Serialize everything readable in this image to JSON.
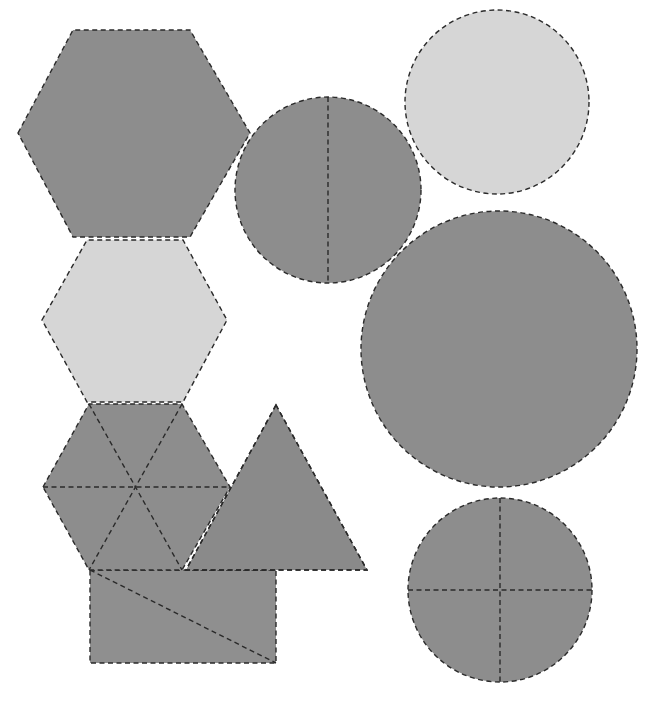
{
  "diagram": {
    "colors": {
      "dark_fill": "#8d8d8d",
      "light_fill": "#d6d6d6",
      "outline": "#2a2a2a",
      "background": "#ffffff"
    },
    "shapes": [
      {
        "id": "hexagon-top",
        "type": "hexagon",
        "fill": "dark",
        "partitions": 0,
        "points": [
          [
            18,
            133
          ],
          [
            73,
            30
          ],
          [
            190,
            30
          ],
          [
            250,
            133
          ],
          [
            190,
            237
          ],
          [
            73,
            237
          ]
        ]
      },
      {
        "id": "hexagon-middle",
        "type": "hexagon",
        "fill": "light",
        "partitions": 0,
        "points": [
          [
            42,
            320
          ],
          [
            87,
            240
          ],
          [
            183,
            240
          ],
          [
            227,
            320
          ],
          [
            183,
            402
          ],
          [
            87,
            402
          ]
        ]
      },
      {
        "id": "hexagon-bottom",
        "type": "hexagon",
        "fill": "dark",
        "partitions": 6,
        "points": [
          [
            43,
            487
          ],
          [
            89,
            404
          ],
          [
            182,
            404
          ],
          [
            230,
            487
          ],
          [
            182,
            570
          ],
          [
            89,
            570
          ]
        ],
        "center": [
          136,
          487
        ]
      },
      {
        "id": "triangle",
        "type": "triangle",
        "fill": "dark",
        "partitions": 0,
        "points": [
          [
            276,
            405
          ],
          [
            186,
            570
          ],
          [
            367,
            570
          ]
        ]
      },
      {
        "id": "rectangle",
        "type": "rectangle",
        "fill": "dark",
        "partitions": 2,
        "x": 90,
        "y": 570,
        "width": 186,
        "height": 93,
        "diagonal": [
          [
            90,
            570
          ],
          [
            276,
            663
          ]
        ]
      },
      {
        "id": "circle-halves",
        "type": "circle",
        "fill": "dark",
        "partitions": 2,
        "cx": 328,
        "cy": 190,
        "r": 93
      },
      {
        "id": "circle-light",
        "type": "circle",
        "fill": "light",
        "partitions": 0,
        "cx": 497,
        "cy": 102,
        "r": 92
      },
      {
        "id": "circle-large",
        "type": "circle",
        "fill": "dark",
        "partitions": 0,
        "cx": 499,
        "cy": 349,
        "r": 138
      },
      {
        "id": "circle-quarters",
        "type": "circle",
        "fill": "dark",
        "partitions": 4,
        "cx": 500,
        "cy": 590,
        "r": 92
      }
    ]
  }
}
